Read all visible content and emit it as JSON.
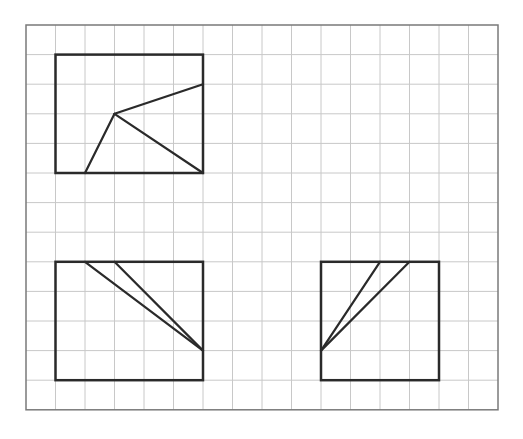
{
  "grid": {
    "origin_x": 26,
    "origin_y": 25,
    "cell_w": 29.5,
    "cell_h": 29.6,
    "cols": 16,
    "rows": 13,
    "grid_color": "#c8c8c8",
    "border_color": "#7a7a7a",
    "shape_color": "#2a2a2a"
  },
  "figures": [
    {
      "name": "figure-top-left",
      "rect": {
        "col0": 1,
        "row0": 1,
        "col1": 6,
        "row1": 5
      },
      "segments": [
        {
          "from": [
            3,
            3
          ],
          "to": [
            2,
            5
          ]
        },
        {
          "from": [
            3,
            3
          ],
          "to": [
            6,
            2
          ]
        },
        {
          "from": [
            3,
            3
          ],
          "to": [
            6,
            5
          ]
        }
      ]
    },
    {
      "name": "figure-bottom-left",
      "rect": {
        "col0": 1,
        "row0": 8,
        "col1": 6,
        "row1": 12
      },
      "segments": [
        {
          "from": [
            2,
            8
          ],
          "to": [
            6,
            11
          ]
        },
        {
          "from": [
            3,
            8
          ],
          "to": [
            6,
            11
          ]
        }
      ]
    },
    {
      "name": "figure-bottom-right",
      "rect": {
        "col0": 10,
        "row0": 8,
        "col1": 14,
        "row1": 12
      },
      "segments": [
        {
          "from": [
            12,
            8
          ],
          "to": [
            10,
            11
          ]
        },
        {
          "from": [
            13,
            8
          ],
          "to": [
            10,
            11
          ]
        }
      ]
    }
  ]
}
